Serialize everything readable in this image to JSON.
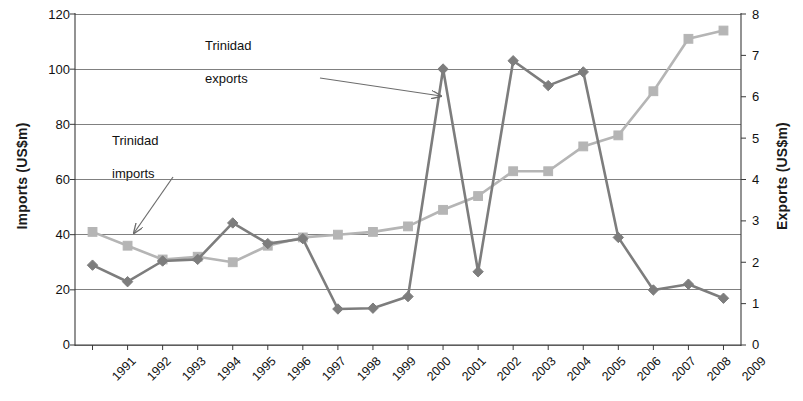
{
  "chart_data": {
    "type": "line",
    "title": "",
    "xlabel": "",
    "ylabel": "Imports  (US$m)",
    "y2label": "Exports  (US$m)",
    "grid": true,
    "legend_position": "none",
    "x": [
      "1991",
      "1992",
      "1993",
      "1994",
      "1995",
      "1996",
      "1997",
      "1998",
      "1999",
      "2000",
      "2001",
      "2002",
      "2003",
      "2004",
      "2005",
      "2006",
      "2007",
      "2008",
      "2009"
    ],
    "ylim": [
      0,
      120
    ],
    "yticks": [
      "0",
      "20",
      "40",
      "60",
      "80",
      "100",
      "120"
    ],
    "y2lim": [
      0,
      8
    ],
    "y2ticks": [
      "0",
      "1",
      "2",
      "3",
      "4",
      "5",
      "6",
      "7",
      "8"
    ],
    "series": [
      {
        "name": "Trinidad imports",
        "axis": "left",
        "unit": "US$m",
        "marker": "square",
        "color": "#b5b5b5",
        "values": [
          41,
          36,
          31,
          32,
          30,
          36,
          39,
          40,
          41,
          43,
          49,
          54,
          63,
          63,
          72,
          76,
          92,
          111,
          114
        ]
      },
      {
        "name": "Trinidad exports",
        "axis": "right",
        "unit": "US$m",
        "marker": "diamond",
        "color": "#7d7d7d",
        "values": [
          1.93,
          1.53,
          2.03,
          2.07,
          2.95,
          2.45,
          2.57,
          0.87,
          0.89,
          1.17,
          6.67,
          1.77,
          6.87,
          6.27,
          6.6,
          2.6,
          1.33,
          1.47,
          1.13
        ],
        "values_on_left_scale": [
          29,
          23,
          30.5,
          31,
          44.2,
          36.7,
          38.5,
          13,
          13.3,
          17.5,
          100,
          26.5,
          103,
          94,
          99,
          39,
          20,
          22,
          17
        ]
      }
    ],
    "annotations": [
      {
        "name": "trinidad-exports-annotation",
        "line1": "Trinidad",
        "line2": "exports",
        "arrow_from": [
          320,
          78
        ],
        "arrow_to": [
          441,
          96
        ]
      },
      {
        "name": "trinidad-imports-annotation",
        "line1": "Trinidad",
        "line2": "imports",
        "arrow_from": [
          173,
          177
        ],
        "arrow_to": [
          134,
          233
        ]
      }
    ]
  }
}
